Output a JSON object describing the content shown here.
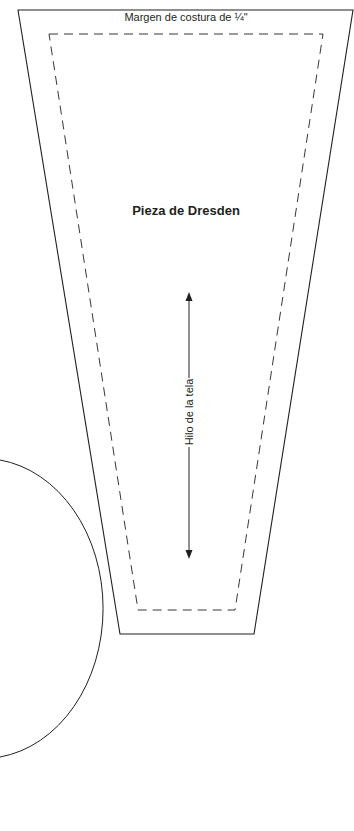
{
  "pattern": {
    "seam_allowance_label": "Margen de costura de ¼\"",
    "piece_title": "Pieza de Dresden",
    "grain_line_label": "Hilo de la tela"
  },
  "colors": {
    "line": "#231f20",
    "background": "#ffffff"
  }
}
